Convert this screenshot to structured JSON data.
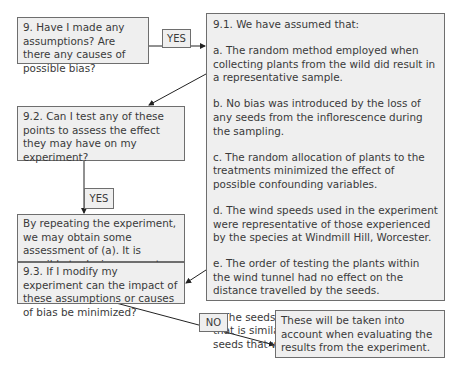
{
  "boxes": {
    "q9": "9. Have I made any assumptions?  Are there any causes of possible bias?",
    "q9_1_title": "9.1. We have assumed that:",
    "q9_1_items": [
      "a. The random method employed when collecting plants from the wild did result in a representative sample.",
      "b. No bias was introduced by the loss of any seeds from the inflorescence during the sampling.",
      "c. The random allocation of plants to the treatments minimized the effect of possible confounding variables.",
      "d. The wind speeds used in the experiment were representative of those experienced by the species at Windmill Hill, Worcester.",
      "e. The order of testing the plants within the wind tunnel had no effect on the distance travelled by the seeds.",
      "f. The seeds were blown along in a manner that is similar to that in the field, including seeds that were blown along the ground."
    ],
    "q9_2": "9.2. Can I test any of these points to assess the effect they may have on my experiment?",
    "answer_9_2": "By repeating the experiment, we may obtain some assessment of (a). It is possible to design separate experiments to check (d), (e), and (f).",
    "q9_3": "9.3. If I modify my experiment can the impact of these assumptions or causes of bias be minimized?",
    "conclusion": "These will be taken into account when evaluating the results from the experiment."
  },
  "labels": {
    "yes_1": "YES",
    "yes_2": "YES",
    "no": "NO"
  }
}
